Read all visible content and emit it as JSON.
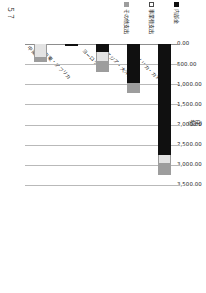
{
  "chart_data": {
    "type": "bar",
    "orientation": "horizontal-stacked",
    "title": "",
    "unit_label": "(億円)",
    "xlabel": "",
    "ylabel": "",
    "xlim": [
      0,
      3500
    ],
    "grid": true,
    "legend_position": "left",
    "xticks": [
      "0.00",
      "500.00",
      "1,000.00",
      "1,500.00",
      "2,000.00",
      "2,500.00",
      "3,000.00",
      "3,500.00"
    ],
    "xtick_values": [
      0,
      500,
      1000,
      1500,
      2000,
      2500,
      3000,
      3500
    ],
    "categories": [
      "アメリカ・カナダ",
      "アジア・大洋州",
      "ヨーロッパ",
      "中東・アフリカ",
      "中南米"
    ],
    "series": [
      {
        "name": "内部金",
        "color": "#101010",
        "values": [
          2760,
          980,
          190,
          50,
          0
        ]
      },
      {
        "name": "事業費支出",
        "color": "#e3e3e3",
        "values": [
          200,
          0,
          240,
          0,
          330
        ]
      },
      {
        "name": "その他支出",
        "color": "#9d9d9d",
        "values": [
          280,
          225,
          270,
          0,
          120
        ]
      }
    ],
    "totals": [
      3240,
      1205,
      700,
      50,
      450
    ]
  },
  "legend": {
    "items": [
      {
        "label": "内部金",
        "swatch": "black-square-icon"
      },
      {
        "label": "事業費支出",
        "swatch": "white-square-icon"
      },
      {
        "label": "その他支出",
        "swatch": "gray-square-icon"
      }
    ]
  },
  "page": {
    "corner_mark": "５７"
  }
}
